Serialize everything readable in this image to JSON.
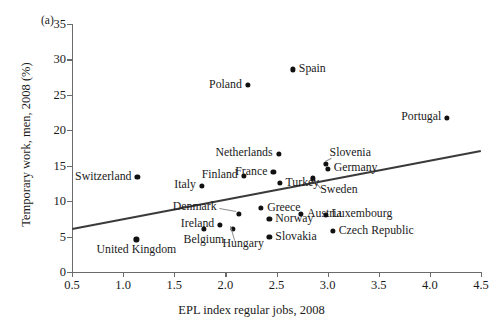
{
  "panel_label": "(a)",
  "chart_data": {
    "type": "scatter",
    "title": "",
    "xlabel": "EPL index regular jobs, 2008",
    "ylabel": "Temporary work, men, 2008 (%)",
    "xlim": [
      0.5,
      4.5
    ],
    "ylim": [
      0,
      35
    ],
    "xticks": [
      "0.5",
      "1.0",
      "1.5",
      "2.0",
      "2.5",
      "3.0",
      "3.5",
      "4.0",
      "4.5"
    ],
    "yticks": [
      "0",
      "5",
      "10",
      "15",
      "20",
      "25",
      "30",
      "35"
    ],
    "grid": false,
    "legend": "none",
    "marker_color": "#111111",
    "trendline_color": "#3a3a3a",
    "trendline": {
      "x0": 0.5,
      "y0": 6.2,
      "x1": 4.5,
      "y1": 17.2
    },
    "points": [
      {
        "label": "Spain",
        "x": 2.66,
        "y": 28.6,
        "label_pos": "right"
      },
      {
        "label": "Poland",
        "x": 2.22,
        "y": 26.4,
        "label_pos": "left"
      },
      {
        "label": "Portugal",
        "x": 4.17,
        "y": 21.8,
        "label_pos": "left"
      },
      {
        "label": "Netherlands",
        "x": 2.52,
        "y": 16.7,
        "label_pos": "left"
      },
      {
        "label": "Slovenia",
        "x": 2.98,
        "y": 15.2,
        "label_pos": "leader-up"
      },
      {
        "label": "Germany",
        "x": 3.0,
        "y": 14.6,
        "label_pos": "right"
      },
      {
        "label": "France",
        "x": 2.47,
        "y": 14.1,
        "label_pos": "left"
      },
      {
        "label": "Finland",
        "x": 2.18,
        "y": 13.6,
        "label_pos": "left"
      },
      {
        "label": "Switzerland",
        "x": 1.14,
        "y": 13.4,
        "label_pos": "left"
      },
      {
        "label": "Sweden",
        "x": 2.86,
        "y": 13.2,
        "label_pos": "leader-right"
      },
      {
        "label": "Turkey",
        "x": 2.53,
        "y": 12.6,
        "label_pos": "right"
      },
      {
        "label": "Italy",
        "x": 1.77,
        "y": 12.2,
        "label_pos": "left"
      },
      {
        "label": "Denmark",
        "x": 2.13,
        "y": 8.2,
        "label_pos": "leader-left"
      },
      {
        "label": "Greece",
        "x": 2.35,
        "y": 9.0,
        "label_pos": "right"
      },
      {
        "label": "Austria",
        "x": 2.74,
        "y": 8.2,
        "label_pos": "right"
      },
      {
        "label": "Luxembourg",
        "x": 2.98,
        "y": 8.1,
        "label_pos": "right"
      },
      {
        "label": "Ireland",
        "x": 1.95,
        "y": 6.7,
        "label_pos": "left"
      },
      {
        "label": "Norway",
        "x": 2.43,
        "y": 7.5,
        "label_pos": "right"
      },
      {
        "label": "Hungary",
        "x": 2.07,
        "y": 6.1,
        "label_pos": "leader-down"
      },
      {
        "label": "Belgium",
        "x": 1.79,
        "y": 6.1,
        "label_pos": "below"
      },
      {
        "label": "Czech Republic",
        "x": 3.05,
        "y": 5.8,
        "label_pos": "right"
      },
      {
        "label": "Slovakia",
        "x": 2.43,
        "y": 4.9,
        "label_pos": "right"
      },
      {
        "label": "United Kingdom",
        "x": 1.13,
        "y": 4.6,
        "label_pos": "below"
      }
    ]
  }
}
